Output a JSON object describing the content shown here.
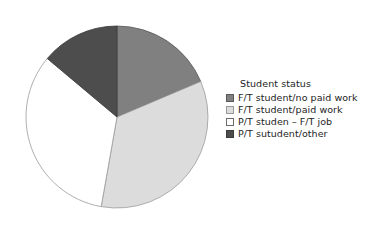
{
  "chart_data": {
    "type": "pie",
    "title": "",
    "legend_title": "Student status",
    "legend_position": "right",
    "grid": false,
    "categories": [
      "F/T student/no paid work",
      "F/T student/paid work",
      "P/T studen – F/T job",
      "P/T sutudent/other"
    ],
    "values": [
      18.6,
      34.2,
      33.3,
      13.9
    ],
    "unit": "percent",
    "start_angle_deg": 0,
    "direction": "clockwise",
    "slices": [
      {
        "label": "F/T student/no paid work",
        "value": 18.6,
        "start_deg": 0,
        "end_deg": 67,
        "color": "#808080",
        "border": "#5a5a5a"
      },
      {
        "label": "F/T student/paid work",
        "value": 34.2,
        "start_deg": 67,
        "end_deg": 190,
        "color": "#dcdcdc",
        "border": "#9a9a9a"
      },
      {
        "label": "P/T studen – F/T job",
        "value": 33.3,
        "start_deg": 190,
        "end_deg": 310,
        "color": "#ffffff",
        "border": "#9a9a9a"
      },
      {
        "label": "P/T sutudent/other",
        "value": 13.9,
        "start_deg": 310,
        "end_deg": 360,
        "color": "#4d4d4d",
        "border": "#3a3a3a"
      }
    ],
    "geometry": {
      "center_x": 97,
      "center_y": 103,
      "radius": 91
    }
  },
  "legend": {
    "title": "Student status",
    "items": [
      {
        "label": "F/T student/no paid work",
        "color": "#808080",
        "border": "#5a5a5a"
      },
      {
        "label": "F/T student/paid work",
        "color": "#dcdcdc",
        "border": "#9a9a9a"
      },
      {
        "label": "P/T studen – F/T job",
        "color": "#ffffff",
        "border": "#6b6b6b"
      },
      {
        "label": "P/T sutudent/other",
        "color": "#4d4d4d",
        "border": "#3a3a3a"
      }
    ]
  },
  "colors": {
    "background": "#ffffff",
    "text": "#1d1d1d",
    "slice_medium_gray": "#808080",
    "slice_light_gray": "#dcdcdc",
    "slice_white": "#ffffff",
    "slice_dark_gray": "#4d4d4d"
  }
}
